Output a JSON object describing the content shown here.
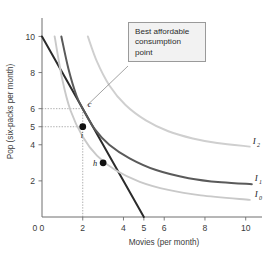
{
  "chart_data": {
    "type": "line",
    "title": "",
    "xlabel": "Movies (per month)",
    "ylabel": "Pop (six-packs per month)",
    "xlim": [
      0,
      10.8
    ],
    "ylim": [
      0,
      10.8
    ],
    "xticks": [
      0,
      2,
      4,
      5,
      6,
      8,
      10
    ],
    "xticklabels": [
      "0",
      "2",
      "4",
      "5",
      "6",
      "8",
      "10"
    ],
    "yticks": [
      2,
      4,
      5,
      6,
      8,
      10
    ],
    "yticklabels": [
      "2",
      "4",
      "5",
      "6",
      "8",
      "10"
    ],
    "grid": false,
    "legend": "inline-right",
    "series": [
      {
        "name": "Budget line",
        "color": "#2b2b2b",
        "kind": "line",
        "points": [
          [
            0,
            10
          ],
          [
            5,
            0
          ]
        ]
      },
      {
        "name": "I0",
        "color": "#c9c9c9",
        "kind": "indifference-curve",
        "points": [
          [
            0.62,
            10
          ],
          [
            1.0,
            7.6
          ],
          [
            1.4,
            5.9
          ],
          [
            2.0,
            4.45
          ],
          [
            2.7,
            3.4
          ],
          [
            3.6,
            2.6
          ],
          [
            4.8,
            1.95
          ],
          [
            6.2,
            1.5
          ],
          [
            7.8,
            1.2
          ],
          [
            10.2,
            0.95
          ]
        ]
      },
      {
        "name": "I1",
        "color": "#5a5a5a",
        "kind": "indifference-curve",
        "points": [
          [
            0.95,
            10
          ],
          [
            1.3,
            8.2
          ],
          [
            1.7,
            6.7
          ],
          [
            2.0,
            6.0
          ],
          [
            2.6,
            4.85
          ],
          [
            3.3,
            4.0
          ],
          [
            4.3,
            3.25
          ],
          [
            5.6,
            2.6
          ],
          [
            7.2,
            2.15
          ],
          [
            8.8,
            1.92
          ],
          [
            10.3,
            1.82
          ]
        ]
      },
      {
        "name": "I2",
        "color": "#cfcfcf",
        "kind": "indifference-curve",
        "points": [
          [
            2.25,
            10
          ],
          [
            2.7,
            8.6
          ],
          [
            3.3,
            7.3
          ],
          [
            4.1,
            6.2
          ],
          [
            5.1,
            5.35
          ],
          [
            6.2,
            4.75
          ],
          [
            7.4,
            4.35
          ],
          [
            8.6,
            4.1
          ],
          [
            10.2,
            3.9
          ]
        ]
      }
    ],
    "curve_labels": [
      {
        "name": "I2",
        "base": "I",
        "sub": "2",
        "x": 10.35,
        "y": 4.05
      },
      {
        "name": "I1",
        "base": "I",
        "sub": "1",
        "x": 10.45,
        "y": 2.0
      },
      {
        "name": "I0",
        "base": "I",
        "sub": "0",
        "x": 10.45,
        "y": 1.12
      }
    ],
    "points": [
      {
        "name": "c",
        "label": "c",
        "x": 2,
        "y": 6,
        "filled": false,
        "label_dx": 5,
        "label_dy": -2
      },
      {
        "name": "i",
        "label": "i",
        "x": 2,
        "y": 5,
        "filled": true,
        "label_dx": -2,
        "label_dy": 11
      },
      {
        "name": "h",
        "label": "h",
        "x": 3,
        "y": 3,
        "filled": true,
        "label_dx": -10,
        "label_dy": 3
      }
    ],
    "guides": [
      {
        "name": "y6-guide",
        "from": [
          0,
          6
        ],
        "to": [
          2,
          6
        ]
      },
      {
        "name": "y5-guide",
        "from": [
          0,
          5
        ],
        "to": [
          2,
          5
        ]
      },
      {
        "name": "x2-guide",
        "from": [
          2,
          0
        ],
        "to": [
          2,
          6
        ]
      }
    ],
    "annotation": {
      "name": "best-affordable-consumption-point",
      "lines": [
        "Best affordable",
        "consumption",
        "point"
      ],
      "text": "Best affordable consumption point",
      "target_point": "c"
    },
    "colors": {
      "budget_line": "#2b2b2b",
      "i0": "#c9c9c9",
      "i1": "#5a5a5a",
      "i2": "#cfcfcf",
      "axis": "#6e6e6e",
      "guide": "#9a9a9a",
      "callout_bg": "#f2f2f2",
      "callout_border": "#9a9a9a",
      "text": "#3b3b3b"
    }
  }
}
